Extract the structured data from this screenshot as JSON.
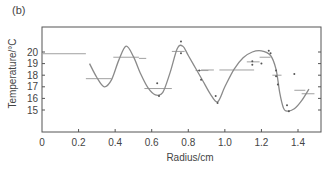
{
  "panel_label": "(b)",
  "chart_data": {
    "type": "line",
    "title": "",
    "panel": "(b)",
    "xlabel": "Radius/cm",
    "ylabel": "Temperature/°C",
    "xlim": [
      0,
      1.5
    ],
    "ylim": [
      14,
      21.5
    ],
    "grid": false,
    "legend": null,
    "x_ticks": [
      "0",
      "0.2",
      "0.4",
      "0.6",
      "0.8",
      "1.0",
      "1.2",
      "1.4"
    ],
    "y_ticks": [
      "15",
      "16",
      "17",
      "18",
      "19",
      "20"
    ],
    "series": [
      {
        "name": "fitted curve",
        "style": "smooth line",
        "x": [
          0.26,
          0.3,
          0.34,
          0.38,
          0.42,
          0.46,
          0.5,
          0.54,
          0.58,
          0.62,
          0.66,
          0.7,
          0.74,
          0.77,
          0.8,
          0.84,
          0.88,
          0.92,
          0.96,
          1.0,
          1.05,
          1.1,
          1.15,
          1.2,
          1.25,
          1.28,
          1.3,
          1.32,
          1.34,
          1.38,
          1.42,
          1.46
        ],
        "y": [
          19.0,
          17.8,
          17.0,
          17.6,
          19.3,
          20.5,
          19.6,
          18.1,
          16.9,
          16.3,
          16.5,
          18.2,
          20.3,
          20.5,
          19.7,
          18.6,
          17.5,
          16.4,
          15.7,
          17.0,
          18.5,
          19.5,
          20.0,
          20.1,
          19.7,
          18.5,
          16.5,
          15.2,
          14.9,
          15.1,
          15.8,
          16.8
        ]
      },
      {
        "name": "measured points",
        "style": "scatter",
        "x": [
          0.63,
          0.64,
          0.76,
          0.76,
          0.86,
          0.87,
          0.95,
          0.96,
          1.15,
          1.15,
          1.2,
          1.24,
          1.25,
          1.28,
          1.28,
          1.29,
          1.34,
          1.35,
          1.38
        ],
        "y": [
          17.3,
          16.2,
          20.9,
          19.9,
          18.4,
          17.6,
          16.2,
          15.6,
          19.2,
          18.9,
          19.0,
          20.1,
          19.9,
          18.4,
          17.9,
          17.2,
          15.4,
          14.9,
          18.1
        ]
      },
      {
        "name": "interval means",
        "style": "horizontal segments",
        "segments": [
          {
            "x0": 0.0,
            "x1": 0.24,
            "y": 19.85
          },
          {
            "x0": 0.24,
            "x1": 0.38,
            "y": 17.7
          },
          {
            "x0": 0.39,
            "x1": 0.53,
            "y": 19.55
          },
          {
            "x0": 0.53,
            "x1": 0.57,
            "y": 19.45
          },
          {
            "x0": 0.56,
            "x1": 0.71,
            "y": 16.85
          },
          {
            "x0": 0.71,
            "x1": 0.78,
            "y": 20.05
          },
          {
            "x0": 0.84,
            "x1": 0.91,
            "y": 18.4
          },
          {
            "x0": 0.87,
            "x1": 0.94,
            "y": 18.45
          },
          {
            "x0": 0.97,
            "x1": 1.16,
            "y": 18.45
          },
          {
            "x0": 1.12,
            "x1": 1.19,
            "y": 19.15
          },
          {
            "x0": 1.19,
            "x1": 1.25,
            "y": 19.55
          },
          {
            "x0": 1.26,
            "x1": 1.31,
            "y": 18.0
          },
          {
            "x0": 1.38,
            "x1": 1.44,
            "y": 16.7
          },
          {
            "x0": 1.42,
            "x1": 1.49,
            "y": 16.4
          }
        ]
      }
    ]
  },
  "colors": {
    "axis": "#555555",
    "curve": "#8a8a8a",
    "segments": "#a0a0a0",
    "points": "#555555",
    "text": "#444444"
  }
}
